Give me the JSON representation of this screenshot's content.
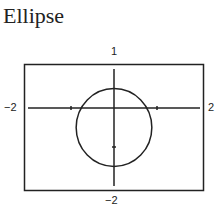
{
  "title": "Ellipse",
  "labels": {
    "ymax": "1",
    "ymin": "−2",
    "xmin": "−2",
    "xmax": "2"
  },
  "chart_data": {
    "type": "line",
    "title": "Ellipse",
    "xlabel": "",
    "ylabel": "",
    "xlim": [
      -2,
      2
    ],
    "ylim": [
      -2,
      1
    ],
    "grid": false,
    "tick_labels": {
      "x": [
        "-2",
        "2"
      ],
      "y": [
        "-2",
        "1"
      ]
    },
    "series": [
      {
        "name": "ellipse",
        "shape": "ellipse",
        "center": [
          0,
          -0.5
        ],
        "semi_axis_x": 0.88,
        "semi_axis_y": 1.0
      }
    ],
    "axis_ticks": {
      "x": [
        -1,
        1
      ],
      "y": [
        -1
      ]
    }
  }
}
